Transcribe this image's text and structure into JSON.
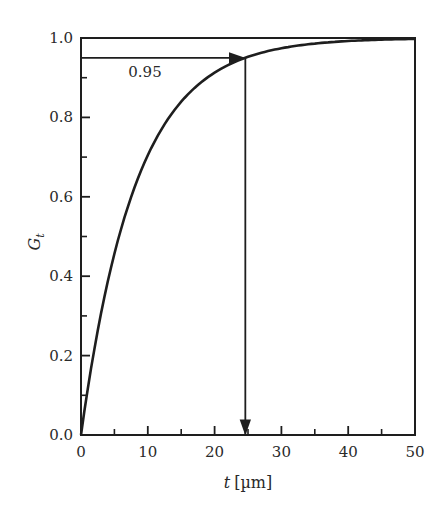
{
  "chart_data": {
    "type": "line",
    "title": "",
    "xlabel": "t [µm]",
    "xlabel_italic_part": "t",
    "xlabel_unit": "[µm]",
    "ylabel": "G_t",
    "ylabel_main": "G",
    "ylabel_sub": "t",
    "xlim": [
      0,
      50
    ],
    "ylim": [
      0.0,
      1.0
    ],
    "x_ticks": [
      0,
      10,
      20,
      30,
      40,
      50
    ],
    "x_tick_labels": [
      "0",
      "10",
      "20",
      "30",
      "40",
      "50"
    ],
    "x_minor_ticks": [
      5,
      15,
      25,
      35,
      45
    ],
    "y_ticks": [
      0.0,
      0.2,
      0.4,
      0.6,
      0.8,
      1.0
    ],
    "y_tick_labels": [
      "0.0",
      "0.2",
      "0.4",
      "0.6",
      "0.8",
      "1.0"
    ],
    "y_minor_ticks": [
      0.1,
      0.3,
      0.5,
      0.7,
      0.9
    ],
    "grid": false,
    "legend": null,
    "series": [
      {
        "name": "G_t",
        "description": "saturating curve G_t = 1 - exp(-t/8.2)",
        "x": [
          0,
          2.5,
          5,
          7.5,
          10,
          12.5,
          15,
          17.5,
          20,
          22.5,
          24.6,
          27.5,
          30,
          35,
          40,
          45,
          50
        ],
        "y": [
          0.0,
          0.26,
          0.46,
          0.6,
          0.7,
          0.78,
          0.84,
          0.88,
          0.91,
          0.94,
          0.95,
          0.965,
          0.975,
          0.986,
          0.992,
          0.996,
          0.998
        ]
      }
    ],
    "annotations": [
      {
        "type": "hline_arrow",
        "from": [
          0,
          0.95
        ],
        "to": [
          24.6,
          0.95
        ],
        "label": "0.95"
      },
      {
        "type": "vline_arrow",
        "from": [
          24.6,
          0.95
        ],
        "to": [
          24.6,
          0.0
        ]
      }
    ],
    "reference_line": {
      "y": 1.0,
      "description": "top frame at G=1.0"
    }
  }
}
